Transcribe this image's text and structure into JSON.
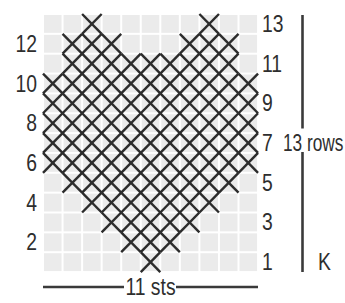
{
  "figure": {
    "type": "knitting-stitch-chart",
    "columns": 11,
    "rows": 13,
    "cell_symbol": "X",
    "marked_cells_by_row": [
      {
        "row": 13,
        "columns": [
          3,
          9
        ]
      },
      {
        "row": 12,
        "columns": [
          2,
          3,
          4,
          8,
          9,
          10
        ]
      },
      {
        "row": 11,
        "columns": [
          2,
          3,
          4,
          5,
          6,
          7,
          8,
          9,
          10
        ]
      },
      {
        "row": 10,
        "columns": [
          1,
          2,
          3,
          4,
          5,
          6,
          7,
          8,
          9,
          10,
          11
        ]
      },
      {
        "row": 9,
        "columns": [
          1,
          2,
          3,
          4,
          5,
          6,
          7,
          8,
          9,
          10,
          11
        ]
      },
      {
        "row": 8,
        "columns": [
          1,
          2,
          3,
          4,
          5,
          6,
          7,
          8,
          9,
          10,
          11
        ]
      },
      {
        "row": 7,
        "columns": [
          1,
          2,
          3,
          4,
          5,
          6,
          7,
          8,
          9,
          10,
          11
        ]
      },
      {
        "row": 6,
        "columns": [
          1,
          2,
          3,
          4,
          5,
          6,
          7,
          8,
          9,
          10,
          11
        ]
      },
      {
        "row": 5,
        "columns": [
          2,
          3,
          4,
          5,
          6,
          7,
          8,
          9,
          10
        ]
      },
      {
        "row": 4,
        "columns": [
          3,
          4,
          5,
          6,
          7,
          8,
          9
        ]
      },
      {
        "row": 3,
        "columns": [
          4,
          5,
          6,
          7,
          8
        ]
      },
      {
        "row": 2,
        "columns": [
          5,
          6,
          7
        ]
      },
      {
        "row": 1,
        "columns": [
          6
        ]
      }
    ]
  },
  "labels": {
    "left_row_numbers": [
      "12",
      "10",
      "8",
      "6",
      "4",
      "2"
    ],
    "right_row_numbers": [
      "13",
      "11",
      "9",
      "7",
      "5",
      "3",
      "1"
    ],
    "rows_bracket": "13 rows",
    "knit": "K",
    "stitches": "11 sts"
  },
  "colors": {
    "background": "#ffffff",
    "cell_fill": "#ebebeb",
    "grid_line": "#ffffff",
    "mark": "#2c2c2c",
    "text": "#2e2e2e",
    "rule_line": "#3a3a3a"
  }
}
